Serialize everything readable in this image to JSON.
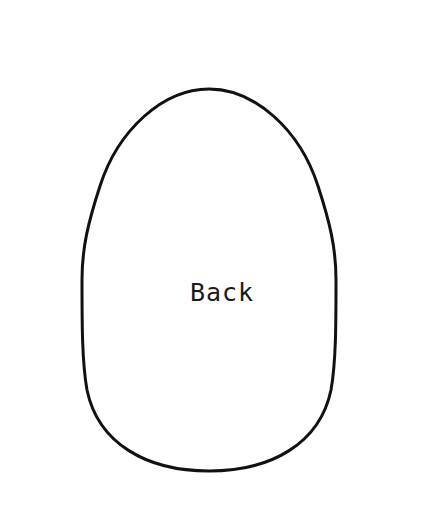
{
  "document": {
    "kind": "sewing-pattern-template",
    "background_color": "#ffffff",
    "width": 444,
    "height": 512
  },
  "pattern": {
    "label": "Back",
    "label_color": "#1a1a1a",
    "outline_color": "#111111",
    "outline_width": 3,
    "fill_color": "#ffffff",
    "stitch_marks": {
      "color": "#6b6b6b",
      "width": 2,
      "length": 13,
      "count_per_side": 33,
      "start_y": 270
    },
    "shape": {
      "type": "egg-ovoid",
      "apex_x": 209,
      "top_y": 89,
      "bottom_y": 471,
      "left_x": 82,
      "right_x": 336,
      "widest_y": 268
    }
  },
  "chart_data": {
    "type": "diagram",
    "title": "Back",
    "outline_path": "M 209 89 C 255 89 300 130 318 186 C 330 223 336 248 336 280 C 336 324 336 362 331 390 C 320 443 272 471 209 471 C 146 471 98 443 87 390 C 82 362 82 324 82 280 C 82 248 88 223 100 186 C 118 130 163 89 209 89 Z"
  }
}
